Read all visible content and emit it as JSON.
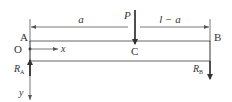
{
  "diagram": {
    "type": "simply-supported-beam",
    "labels": {
      "point_a": "A",
      "point_b": "B",
      "point_c": "C",
      "origin": "O",
      "load": "P",
      "x_axis": "x",
      "y_axis": "y",
      "reaction_a": "R",
      "reaction_a_sub": "A",
      "reaction_b": "R",
      "reaction_b_sub": "B",
      "dim_left": "a",
      "dim_right": "l − a"
    },
    "colors": {
      "line": "#333333",
      "beam": "#555555",
      "background": "#ffffff"
    }
  }
}
